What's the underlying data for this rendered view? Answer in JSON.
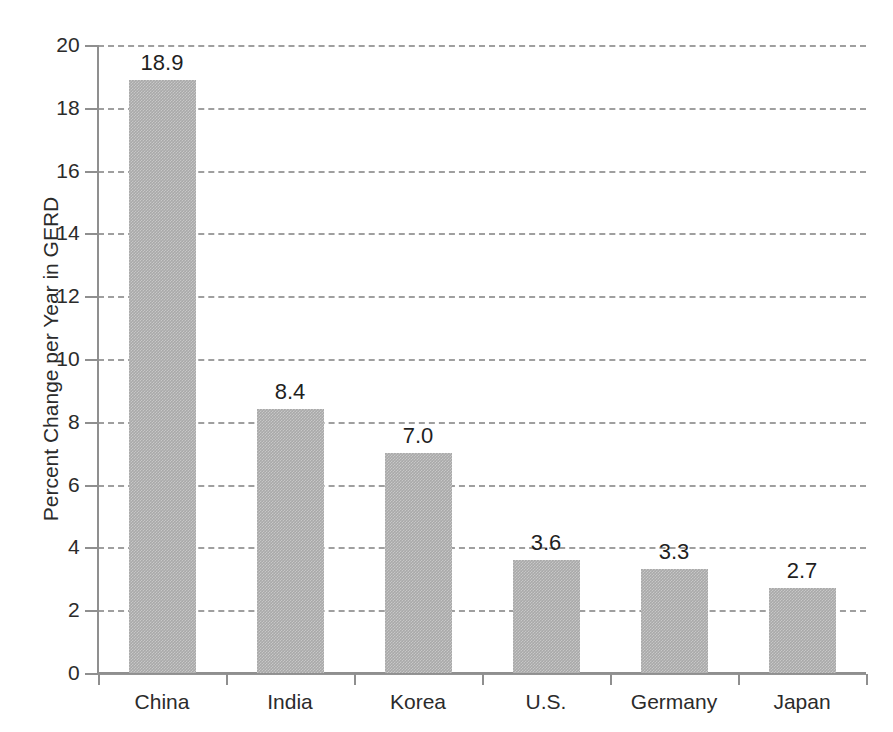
{
  "chart_data": {
    "type": "bar",
    "title": "",
    "subtitle": "",
    "xlabel": "",
    "ylabel": "Percent Change per Year in GERD",
    "categories": [
      "China",
      "India",
      "Korea",
      "U.S.",
      "Germany",
      "Japan"
    ],
    "values": [
      18.9,
      8.4,
      7.0,
      3.6,
      3.3,
      2.7
    ],
    "value_labels": [
      "18.9",
      "8.4",
      "7.0",
      "3.6",
      "3.3",
      "2.7"
    ],
    "ylim": [
      0,
      20
    ],
    "ytick_labels": [
      "0",
      "2",
      "4",
      "6",
      "8",
      "10",
      "12",
      "14",
      "16",
      "18",
      "20"
    ],
    "ytick_values": [
      0,
      2,
      4,
      6,
      8,
      10,
      12,
      14,
      16,
      18,
      20
    ],
    "grid": "horizontal-dashed",
    "legend": "none",
    "bar_color": "#a9a9a9",
    "grid_color": "#9a9a9a",
    "axis_color": "#8f8f8f",
    "text_color": "#2b2b2b",
    "background": "#ffffff"
  }
}
